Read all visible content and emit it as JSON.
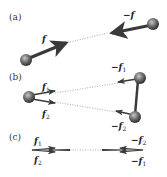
{
  "panels": [
    {
      "label": "(a)",
      "forces": [
        {
          "label": "f",
          "sub": ""
        },
        {
          "label": "−f",
          "sub": ""
        }
      ]
    },
    {
      "label": "(b)",
      "forces": [
        {
          "label": "f",
          "sub": "1"
        },
        {
          "label": "f",
          "sub": "2"
        },
        {
          "label": "−f",
          "sub": "1"
        },
        {
          "label": "−f",
          "sub": "2"
        }
      ]
    },
    {
      "label": "(c)",
      "forces": [
        {
          "label": "f",
          "sub": "1"
        },
        {
          "label": "f",
          "sub": "2"
        },
        {
          "label": "−f",
          "sub": "2"
        },
        {
          "label": "−f",
          "sub": "1"
        }
      ]
    }
  ],
  "colors": {
    "arrow": "#3a3a3a",
    "sphere_dark": "#3c3c3c",
    "sphere_light": "#bdbdbd",
    "dotted": "#aaaaaa"
  }
}
